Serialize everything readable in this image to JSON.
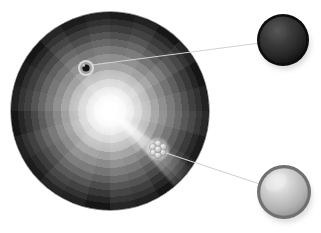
{
  "figure": {
    "title": "Protoplanetary disc with embedded bodies",
    "background_color": "#ffffff",
    "width": 321,
    "height": 233
  },
  "disc": {
    "name": "radial-sector-disc",
    "center_x": 110,
    "center_y": 111,
    "radius": 99,
    "sector_count": 24,
    "ring_count": 13,
    "core_color": "#ffffff",
    "inner_color": "#f2f2f2",
    "outer_color": "#1a1a1a",
    "rim_color": "#111111",
    "core_glow_radius": 17,
    "brightness_profile_label": "surface brightness falls off with radius",
    "ring_radii": [
      8,
      16,
      24,
      32,
      41,
      49,
      57,
      65,
      72,
      79,
      86,
      92,
      99
    ],
    "ring_gray_values": [
      248,
      238,
      224,
      206,
      186,
      164,
      142,
      120,
      100,
      80,
      62,
      46,
      30
    ],
    "sector_jitter": [
      0,
      6,
      -5,
      9,
      -8,
      4,
      11,
      -3,
      7,
      -10,
      2,
      8,
      -6,
      5,
      10,
      -4,
      3,
      -9,
      6,
      0,
      -7,
      8,
      -2,
      5
    ]
  },
  "beam": {
    "name": "core-light-beam",
    "angle_deg": 42,
    "spread_deg": 15,
    "color": "#ffffff",
    "visible": true
  },
  "objects": [
    {
      "id": "embedded-dark-body",
      "label": "Dark body",
      "x": 86,
      "y": 68,
      "radius": 8,
      "halo_radius": 8,
      "core_radius": 3.6,
      "core_color": "#141414",
      "halo_color": "#dcdcdc",
      "kind": "single-sphere"
    },
    {
      "id": "embedded-sphere-cluster",
      "label": "Sphere cluster",
      "x": 158,
      "y": 149,
      "radius": 11,
      "kind": "cluster",
      "member_count": 7,
      "member_radius": 3.4,
      "member_color": "#d0d0d0",
      "members": [
        {
          "dx": 0,
          "dy": -5.4
        },
        {
          "dx": -5.2,
          "dy": -2.0
        },
        {
          "dx": 5.2,
          "dy": -2.0
        },
        {
          "dx": -4.6,
          "dy": 3.6
        },
        {
          "dx": 4.6,
          "dy": 3.6
        },
        {
          "dx": 0,
          "dy": 6.2
        },
        {
          "dx": 0,
          "dy": 0.4
        }
      ]
    }
  ],
  "callouts": [
    {
      "id": "callout-dark-sphere",
      "label": "Dark sphere detail",
      "source_x": 92,
      "source_y": 65,
      "x": 283,
      "y": 40,
      "radius": 26,
      "body_color": "#2e2e2e",
      "rim_color": "#0c0c0c",
      "highlight_color": "#4a4a4a",
      "shadow_color": "#b9b9b9",
      "line_color": "#d2d2d2",
      "line_width": 1.1
    },
    {
      "id": "callout-light-sphere",
      "label": "Light sphere detail",
      "source_x": 166,
      "source_y": 153,
      "x": 284,
      "y": 192,
      "radius": 27,
      "body_color": "#c2c2c2",
      "rim_color": "#6f6f6f",
      "highlight_color": "#efefef",
      "shadow_color": "#bdbdbd",
      "line_color": "#d2d2d2",
      "line_width": 1.1
    }
  ]
}
